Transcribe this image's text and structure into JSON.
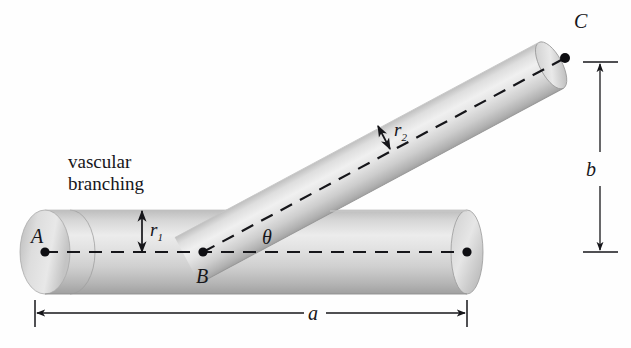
{
  "figure": {
    "title": "vascular branching",
    "caption_line1": "vascular",
    "caption_line2": "branching",
    "background_color": "#fefefe",
    "ink_color": "#16161a",
    "tube_light": "#f2f2f2",
    "tube_mid": "#d8d8d8",
    "tube_dark": "#a9a9a9"
  },
  "points": {
    "a_label": "A",
    "b_label": "B",
    "c_label": "C"
  },
  "dimensions": {
    "horizontal_label": "a",
    "vertical_label": "b"
  },
  "radii": {
    "main_radius_base": "r",
    "main_radius_sub": "1",
    "branch_radius_base": "r",
    "branch_radius_sub": "2"
  },
  "angle": {
    "symbol": "θ"
  },
  "geometry": {
    "main_axis_y": 252,
    "main_left_x": 45,
    "main_right_x": 467,
    "main_radius_px": 42,
    "branch_origin_x": 203,
    "branch_origin_y": 252,
    "branch_end_x": 565,
    "branch_end_y": 58,
    "branch_radius_px": 26,
    "branch_angle_deg": -28,
    "dim_a_y": 313,
    "dim_a_x1": 35,
    "dim_a_x2": 467,
    "dim_b_x": 600,
    "dim_b_y1": 62,
    "dim_b_y2": 252
  }
}
